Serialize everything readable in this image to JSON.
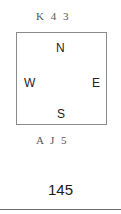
{
  "diagram": {
    "north_hand": "K 4 3",
    "south_hand": "A J 5",
    "compass": {
      "north": "N",
      "west": "W",
      "east": "E",
      "south": "S"
    }
  },
  "page": {
    "number": "145"
  }
}
